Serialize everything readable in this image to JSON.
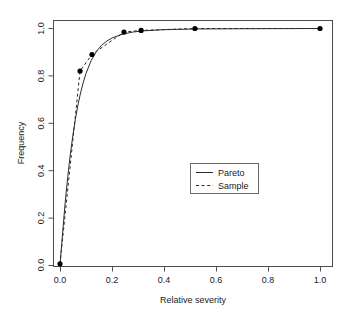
{
  "chart_data": {
    "type": "line",
    "title": "",
    "xlabel": "Relative severity",
    "ylabel": "Frequency",
    "xlim": [
      0.0,
      1.0
    ],
    "ylim": [
      0.0,
      1.0
    ],
    "grid": false,
    "legend_position": "center-right",
    "xticks": [
      0.0,
      0.2,
      0.4,
      0.6,
      0.8,
      1.0
    ],
    "xtick_labels": [
      "0.0",
      "0.2",
      "0.4",
      "0.6",
      "0.8",
      "1.0"
    ],
    "yticks": [
      0.0,
      0.2,
      0.4,
      0.6,
      0.8,
      1.0
    ],
    "ytick_labels": [
      "0.0",
      "0.2",
      "0.4",
      "0.6",
      "0.8",
      "1.0"
    ],
    "series": [
      {
        "name": "Pareto",
        "style": "solid",
        "color": "#2b2b2b",
        "x": [
          0.0,
          0.01,
          0.02,
          0.03,
          0.04,
          0.05,
          0.06,
          0.07,
          0.08,
          0.09,
          0.1,
          0.12,
          0.14,
          0.16,
          0.18,
          0.2,
          0.24,
          0.28,
          0.32,
          0.4,
          0.52,
          0.7,
          1.0
        ],
        "y": [
          0.0,
          0.135,
          0.265,
          0.375,
          0.47,
          0.552,
          0.622,
          0.682,
          0.732,
          0.774,
          0.81,
          0.865,
          0.903,
          0.929,
          0.947,
          0.96,
          0.976,
          0.985,
          0.99,
          0.995,
          0.998,
          0.999,
          1.0
        ]
      },
      {
        "name": "Sample",
        "style": "dashed",
        "color": "#2b2b2b",
        "x": [
          0.0,
          0.077,
          0.123,
          0.246,
          0.312,
          0.519,
          1.0
        ],
        "y": [
          0.005,
          0.82,
          0.89,
          0.985,
          0.992,
          1.0,
          1.0
        ]
      }
    ],
    "points": {
      "name": "Sample observations",
      "marker": "filled-circle",
      "color": "#000000",
      "x": [
        0.0,
        0.077,
        0.123,
        0.246,
        0.312,
        0.519,
        1.0
      ],
      "y": [
        0.005,
        0.82,
        0.89,
        0.985,
        0.992,
        1.0,
        1.0
      ]
    }
  },
  "legend": {
    "entries": [
      {
        "label": "Pareto",
        "style": "solid"
      },
      {
        "label": "Sample",
        "style": "dashed"
      }
    ]
  },
  "axes": {
    "x_title": "Relative severity",
    "y_title": "Frequency"
  }
}
